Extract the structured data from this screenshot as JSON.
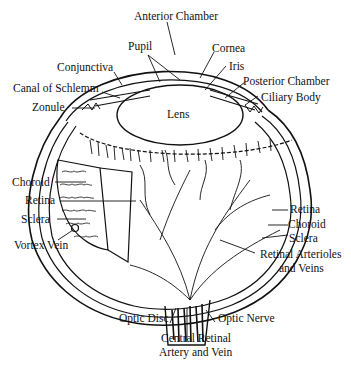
{
  "diagram": {
    "labels": {
      "anterior_chamber": "Anterior Chamber",
      "pupil": "Pupil",
      "cornea": "Cornea",
      "conjunctiva": "Conjunctiva",
      "iris": "Iris",
      "posterior_chamber": "Posterior Chamber",
      "canal_of_schlemm": "Canal of Schlemm",
      "ciliary_body": "Ciliary Body",
      "zonule": "Zonule",
      "lens": "Lens",
      "choroid_left": "Choroid",
      "retina_left": "Retina",
      "sclera_left": "Sclera",
      "vortex_vein": "Vortex Vein",
      "retina_right": "Retina",
      "choroid_right": "Choroid",
      "sclera_right": "Sclera",
      "retinal_arterioles_1": "Retinal Arterioles",
      "retinal_arterioles_2": "and Veins",
      "optic_disc": "Optic Disc",
      "optic_nerve": "Optic Nerve",
      "central_retinal_1": "Central Retinal",
      "central_retinal_2": "Artery and Vein"
    },
    "colors": {
      "ink": "#111111",
      "background": "#ffffff"
    }
  }
}
